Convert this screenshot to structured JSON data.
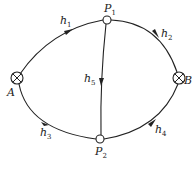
{
  "diagram": {
    "type": "network-graph",
    "nodes": [
      {
        "id": "A",
        "label": "A",
        "kind": "source-sink",
        "x": 17,
        "y": 78
      },
      {
        "id": "B",
        "label": "B",
        "kind": "source-sink",
        "x": 179,
        "y": 78
      },
      {
        "id": "P1",
        "label": "P",
        "subscript": "1",
        "kind": "junction",
        "x": 107,
        "y": 20
      },
      {
        "id": "P2",
        "label": "P",
        "subscript": "2",
        "kind": "junction",
        "x": 100,
        "y": 139
      }
    ],
    "edges": [
      {
        "id": "h1",
        "label": "h",
        "subscript": "1",
        "from": "A",
        "to": "P1"
      },
      {
        "id": "h2",
        "label": "h",
        "subscript": "2",
        "from": "P1",
        "to": "B"
      },
      {
        "id": "h3",
        "label": "h",
        "subscript": "3",
        "from": "A",
        "to": "P2"
      },
      {
        "id": "h4",
        "label": "h",
        "subscript": "4",
        "from": "P2",
        "to": "B"
      },
      {
        "id": "h5",
        "label": "h",
        "subscript": "5",
        "from": "P1",
        "to": "P2"
      }
    ],
    "colors": {
      "stroke": "#222222",
      "background": "#ffffff"
    }
  }
}
